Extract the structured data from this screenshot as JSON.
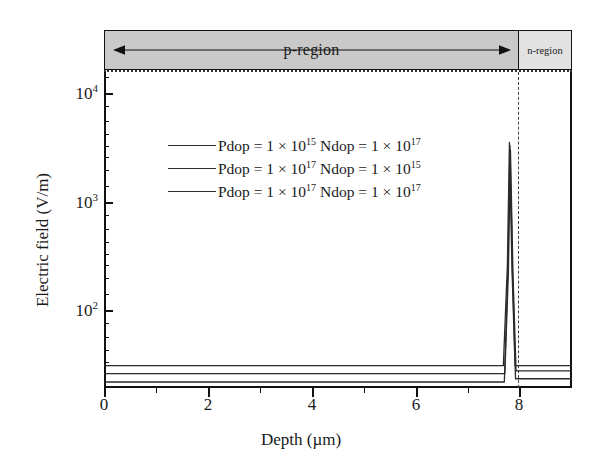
{
  "chart_data": {
    "type": "line",
    "title": "",
    "xlabel": "Depth (µm)",
    "ylabel": "Electric field (V/m)",
    "xlim": [
      0,
      9.2
    ],
    "ylim": [
      40,
      20000
    ],
    "yscale": "log",
    "xticks": [
      0,
      2,
      4,
      6,
      8
    ],
    "xticklabels": [
      "0",
      "2",
      "4",
      "6",
      "8"
    ],
    "yticks": [
      100,
      1000,
      10000
    ],
    "yticklabels": [
      "10²",
      "10³",
      "10⁴"
    ],
    "grid": false,
    "legend_position": "upper-center-left",
    "annotations": [
      {
        "name": "p-region",
        "label": "p-region",
        "x_start": 0.0,
        "x_end": 8.0,
        "arrow": "double-headed"
      },
      {
        "name": "n-region",
        "label": "n-region",
        "x_start": 8.0,
        "x_end": 9.2,
        "arrow": "none"
      },
      {
        "name": "junction",
        "label": "",
        "x": 8.0,
        "style": "dashed-vertical"
      }
    ],
    "series": [
      {
        "name": "Pdop = 1 × 10¹⁵ Ndop = 1 × 10¹⁷",
        "label_plain": "Pdop = 1 x 10^15 Ndop = 1 x 10^17",
        "color": "#2b2b2b",
        "p_plateau": 62,
        "peak_value": 5000,
        "peak_x": 7.97,
        "n_plateau": 62,
        "x": [
          0.0,
          7.85,
          7.93,
          7.97,
          8.02,
          8.08,
          9.2
        ],
        "y": [
          62,
          62,
          450,
          5000,
          420,
          62,
          62
        ]
      },
      {
        "name": "Pdop = 1 × 10¹⁷ Ndop = 1 × 10¹⁵",
        "label_plain": "Pdop = 1 x 10^17 Ndop = 1 x 10^15",
        "color": "#2b2b2b",
        "p_plateau": 53,
        "peak_value": 4300,
        "peak_x": 7.99,
        "n_plateau": 56,
        "x": [
          0.0,
          7.88,
          7.95,
          7.99,
          8.04,
          8.1,
          9.2
        ],
        "y": [
          53,
          53,
          400,
          4300,
          380,
          56,
          56
        ]
      },
      {
        "name": "Pdop = 1 × 10¹⁷ Ndop = 1 × 10¹⁷",
        "label_plain": "Pdop = 1 x 10^17 Ndop = 1 x 10^17",
        "color": "#2b2b2b",
        "p_plateau": 45,
        "peak_value": 4700,
        "peak_x": 7.98,
        "n_plateau": 48,
        "x": [
          0.0,
          7.87,
          7.94,
          7.98,
          8.03,
          8.09,
          9.2
        ],
        "y": [
          45,
          45,
          420,
          4700,
          400,
          48,
          48
        ]
      }
    ]
  },
  "axes": {
    "y_title": "Electric field (V/m)",
    "x_title": "Depth (µm)",
    "y_tick_labels": [
      {
        "base": "10",
        "exp": "4"
      },
      {
        "base": "10",
        "exp": "3"
      },
      {
        "base": "10",
        "exp": "2"
      }
    ],
    "x_tick_labels": [
      "0",
      "2",
      "4",
      "6",
      "8"
    ]
  },
  "regions": {
    "p_label": "p-region",
    "n_label": "n-region",
    "p_fill": "#c9c9c9",
    "n_fill": "#e2e2e2"
  },
  "legend": {
    "entries": [
      {
        "prefix": "Pdop = 1 × 10",
        "exp1": "15",
        "mid": " Ndop = 1 × 10",
        "exp2": "17"
      },
      {
        "prefix": "Pdop = 1 × 10",
        "exp1": "17",
        "mid": " Ndop = 1 × 10",
        "exp2": "15"
      },
      {
        "prefix": "Pdop = 1 × 10",
        "exp1": "17",
        "mid": " Ndop = 1 × 10",
        "exp2": "17"
      }
    ]
  },
  "colors": {
    "line": "#2b2b2b",
    "axis": "#111111",
    "junction": "#444444"
  }
}
